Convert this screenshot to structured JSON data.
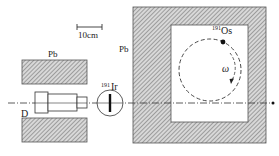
{
  "labels": {
    "scale_bar": "10cm",
    "pb_left": "Pb",
    "pb_right": "Pb",
    "detector": "D",
    "ir_mass": "191",
    "ir_symbol": "Ir",
    "os_mass": "191",
    "os_symbol": "Os",
    "omega": "ω"
  },
  "colors": {
    "line": "#333333",
    "hatch_bg": "#d8d8d8",
    "hatch_line": "#6a6a6a",
    "background": "#ffffff"
  },
  "diagram": {
    "type": "experimental-setup",
    "components": [
      {
        "id": "scale-bar",
        "label": "10cm"
      },
      {
        "id": "pb-shield-top-left",
        "material": "Pb"
      },
      {
        "id": "pb-shield-bottom-left",
        "material": "Pb"
      },
      {
        "id": "detector",
        "label": "D"
      },
      {
        "id": "ir-absorber",
        "label": "191Ir"
      },
      {
        "id": "pb-enclosure",
        "material": "Pb"
      },
      {
        "id": "rotating-source",
        "label": "191Os",
        "motion": "ω"
      }
    ],
    "beam_axis": "horizontal dash-dot line through D, 191Ir and 191Os enclosure"
  }
}
